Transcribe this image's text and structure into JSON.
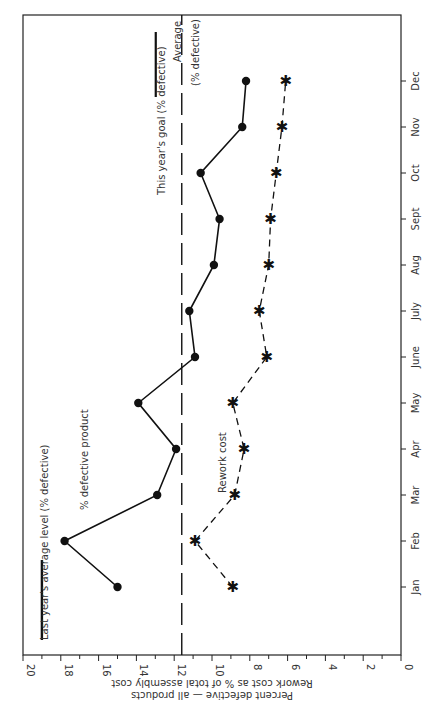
{
  "chart_data": {
    "type": "line",
    "title": "",
    "orientation": "rotated 90° (months along right edge, values along bottom, decreasing left-to-right)",
    "xlabel": "",
    "ylabel": "Percent defective — all products\nRework cost as % of total assembly cost",
    "ylabel_lines": [
      "Rework cost as % of total assembly cost",
      "Percent defective — all products"
    ],
    "ylim": [
      0,
      20
    ],
    "yticks": [
      0,
      2,
      4,
      6,
      8,
      10,
      12,
      14,
      16,
      18,
      20
    ],
    "grid": false,
    "categories": [
      "Jan",
      "Feb",
      "Mar",
      "Apr",
      "May",
      "June",
      "July",
      "Aug",
      "Sept",
      "Oct",
      "Nov",
      "Dec"
    ],
    "series": [
      {
        "name": "% defective product",
        "style": "solid line, filled circle markers",
        "values": [
          15.0,
          17.8,
          12.9,
          11.9,
          13.9,
          10.9,
          11.2,
          9.9,
          9.6,
          10.6,
          8.4,
          8.2
        ]
      },
      {
        "name": "Rework cost",
        "style": "dashed line, asterisk markers",
        "values": [
          8.9,
          10.9,
          8.8,
          8.3,
          8.9,
          7.1,
          7.5,
          7.0,
          6.9,
          6.6,
          6.3,
          6.1
        ]
      }
    ],
    "reference_lines": [
      {
        "name": "Last year's average level (% defective)",
        "value": 19.0,
        "style": "solid heavy"
      },
      {
        "name": "This year's goal (% defective)",
        "value": 11.6,
        "style": "long dash"
      }
    ],
    "annotations": [
      "Last year's average level (% defective)",
      "% defective product",
      "Rework cost",
      "This year's goal (% defective)",
      "Average (% defective)"
    ]
  },
  "labels": {
    "last_year": "Last year's average level (% defective)",
    "defective_series": "% defective product",
    "rework_series": "Rework cost",
    "goal": "This year's goal (% defective)",
    "average_1": "Average",
    "average_2": "(% defective)",
    "axis_line1": "Percent defective — all products",
    "axis_line2": "Rework cost as % of total assembly cost"
  }
}
